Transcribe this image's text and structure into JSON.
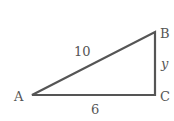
{
  "diagram": {
    "type": "right-triangle",
    "stroke_color": "#555555",
    "vertices": [
      {
        "label": "A",
        "x": 32,
        "y": 95
      },
      {
        "label": "B",
        "x": 155,
        "y": 32
      },
      {
        "label": "C",
        "x": 155,
        "y": 95
      }
    ],
    "sides": {
      "hypotenuse_AB": "10",
      "base_AC": "6",
      "leg_BC": "y"
    }
  }
}
